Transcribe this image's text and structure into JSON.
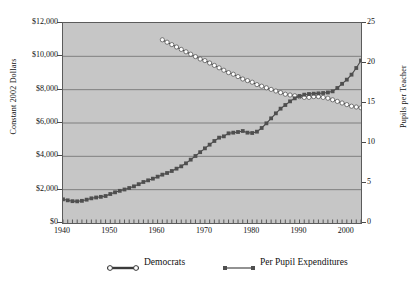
{
  "chart_data": {
    "type": "line",
    "title": "",
    "xlabel": "",
    "ylabel": "Constant 2002 Dollars",
    "y2label": "Pupils per Teacher",
    "xlim": [
      1940,
      2003
    ],
    "ylim": [
      0,
      12000
    ],
    "y2lim": [
      0,
      25
    ],
    "grid": true,
    "legend_position": "bottom",
    "x_ticks": [
      "1940",
      "1950",
      "1960",
      "1970",
      "1980",
      "1990",
      "2000"
    ],
    "x_tick_values": [
      1940,
      1950,
      1960,
      1970,
      1980,
      1990,
      2000
    ],
    "y_ticks": [
      "$0",
      "$2,000",
      "$4,000",
      "$6,000",
      "$8,000",
      "$10,000",
      "$12,000"
    ],
    "y_tick_values": [
      0,
      2000,
      4000,
      6000,
      8000,
      10000,
      12000
    ],
    "y2_ticks": [
      "0",
      "5",
      "10",
      "15",
      "20",
      "25"
    ],
    "y2_tick_values": [
      0,
      5,
      10,
      15,
      20,
      25
    ],
    "series": [
      {
        "name": "Democrats",
        "axis": "right",
        "marker": "hollow-circle",
        "color": "#ffffff",
        "line_color": "#3a3a3a",
        "x": [
          1961,
          1962,
          1963,
          1964,
          1965,
          1966,
          1967,
          1968,
          1969,
          1970,
          1971,
          1972,
          1973,
          1974,
          1975,
          1976,
          1977,
          1978,
          1979,
          1980,
          1981,
          1982,
          1983,
          1984,
          1985,
          1986,
          1987,
          1988,
          1989,
          1990,
          1991,
          1992,
          1993,
          1994,
          1995,
          1996,
          1997,
          1998,
          1999,
          2000,
          2001,
          2002,
          2003
        ],
        "values": [
          22.9,
          22.6,
          22.3,
          22.0,
          21.7,
          21.4,
          21.1,
          20.8,
          20.5,
          20.3,
          20.0,
          19.7,
          19.4,
          19.1,
          18.8,
          18.6,
          18.3,
          18.0,
          17.8,
          17.6,
          17.3,
          17.1,
          16.9,
          16.7,
          16.5,
          16.3,
          16.1,
          16.0,
          15.9,
          15.8,
          15.7,
          15.7,
          15.8,
          15.8,
          15.7,
          15.6,
          15.4,
          15.2,
          15.0,
          14.8,
          14.6,
          14.5,
          14.4
        ]
      },
      {
        "name": "Per Pupil Expenditures",
        "axis": "left",
        "marker": "filled-square",
        "color": "#4f4f4f",
        "line_color": "#4a4a4a",
        "x": [
          1940,
          1941,
          1942,
          1943,
          1944,
          1945,
          1946,
          1947,
          1948,
          1949,
          1950,
          1951,
          1952,
          1953,
          1954,
          1955,
          1956,
          1957,
          1958,
          1959,
          1960,
          1961,
          1962,
          1963,
          1964,
          1965,
          1966,
          1967,
          1968,
          1969,
          1970,
          1971,
          1972,
          1973,
          1974,
          1975,
          1976,
          1977,
          1978,
          1979,
          1980,
          1981,
          1982,
          1983,
          1984,
          1985,
          1986,
          1987,
          1988,
          1989,
          1990,
          1991,
          1992,
          1993,
          1994,
          1995,
          1996,
          1997,
          1998,
          1999,
          2000,
          2001,
          2002,
          2003
        ],
        "values": [
          1420,
          1360,
          1310,
          1300,
          1330,
          1400,
          1480,
          1530,
          1570,
          1620,
          1740,
          1840,
          1930,
          2010,
          2100,
          2200,
          2330,
          2460,
          2560,
          2660,
          2780,
          2900,
          3000,
          3120,
          3260,
          3400,
          3580,
          3800,
          4020,
          4250,
          4480,
          4700,
          4920,
          5120,
          5200,
          5380,
          5420,
          5460,
          5520,
          5420,
          5400,
          5480,
          5700,
          5980,
          6280,
          6580,
          6860,
          7080,
          7300,
          7480,
          7620,
          7700,
          7740,
          7760,
          7780,
          7800,
          7830,
          7900,
          8100,
          8350,
          8600,
          8900,
          9300,
          9750
        ]
      }
    ]
  },
  "legend": {
    "items": [
      {
        "label": "Democrats"
      },
      {
        "label": "Per Pupil Expenditures"
      }
    ]
  },
  "axes": {
    "left_title": "Constant 2002 Dollars",
    "right_title": "Pupils per Teacher"
  }
}
